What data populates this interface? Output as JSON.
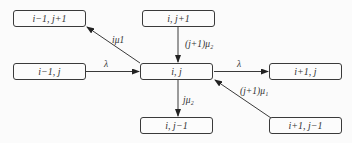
{
  "nodes": {
    "im1_jp1": "i−1, j+1",
    "i_jp1": "i, j+1",
    "im1_j": "i−1, j",
    "i_j": "i, j",
    "ip1_j": "i+1, j",
    "i_jm1": "i, j−1",
    "ip1_jm1": "i+1, j−1"
  },
  "edges": {
    "to_im1_jp1": "iμ1",
    "from_i_jp1": "(j+1)μ₂",
    "from_im1_j": "λ",
    "to_ip1_j": "λ",
    "to_i_jm1": "jμ₂",
    "from_ip1_jm1": "(j+1)μ₁"
  },
  "colors": {
    "line": "#3a3a3a",
    "background": "#fbfbfb"
  }
}
